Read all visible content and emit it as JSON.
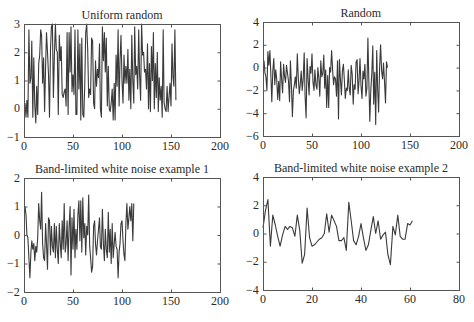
{
  "chart_data": [
    {
      "type": "line",
      "title": "Uniform random",
      "xlabel": "",
      "ylabel": "",
      "xlim": [
        0,
        200
      ],
      "ylim": [
        -1,
        3
      ],
      "xticks": [
        0,
        50,
        100,
        150,
        200
      ],
      "yticks": [
        -1,
        0,
        1,
        2,
        3
      ],
      "grid": false,
      "box": {
        "left": 24,
        "top": 24,
        "right": 220,
        "bottom": 137
      },
      "series": [
        {
          "name": "uniform",
          "color": "#3a3a3a",
          "x_start": 1,
          "x_step": 1,
          "values": [
            0.2,
            -0.3,
            0.3,
            -0.3,
            2.8,
            0.9,
            1.1,
            2.4,
            -0.3,
            1.8,
            0.1,
            -0.5,
            0.8,
            -0.2,
            1.6,
            1.9,
            2.8,
            2.6,
            0.9,
            1.8,
            -0.1,
            1.5,
            2.7,
            2.0,
            1.2,
            -0.3,
            2.1,
            2.9,
            3.0,
            0.4,
            1.9,
            3.0,
            2.1,
            2.0,
            -0.2,
            2.6,
            1.7,
            2.2,
            0.5,
            0.4,
            0.6,
            0.7,
            0.1,
            2.7,
            -0.2,
            2.7,
            1.3,
            2.9,
            0.6,
            1.2,
            0.5,
            2.8,
            -0.2,
            -0.2,
            2.8,
            0.7,
            2.3,
            -0.4,
            2.5,
            -0.2,
            -0.3,
            0.9,
            2.7,
            3.0,
            2.1,
            0.4,
            0.7,
            0.5,
            2.5,
            2.4,
            0.2,
            0.0,
            1.7,
            0.8,
            1.4,
            1.1,
            2.3,
            0.0,
            -0.3,
            2.9,
            1.7,
            2.7,
            1.3,
            2.5,
            0.1,
            1.5,
            0.0,
            -0.1,
            0.2,
            0.7,
            -0.4,
            0.9,
            -0.4,
            1.9,
            0.8,
            2.8,
            0.1,
            1.7,
            2.6,
            1.0,
            0.2,
            1.9,
            0.9,
            1.5,
            0.9,
            2.1,
            0.3,
            1.4,
            0.0,
            2.6,
            1.0,
            0.2,
            2.9,
            1.2,
            1.5,
            0.7,
            2.8,
            1.2,
            0.3,
            3.0,
            1.9,
            2.0,
            1.3,
            1.4,
            0.7,
            2.3,
            0.0,
            1.6,
            -0.1,
            2.2,
            1.0,
            2.7,
            0.0,
            1.6,
            0.4,
            2.0,
            -0.1,
            1.1,
            0.3,
            0.8,
            -0.3,
            2.8,
            0.2,
            0.0,
            -0.1,
            0.8,
            -0.1,
            0.4,
            0.9,
            0.1,
            2.3,
            1.1,
            0.8,
            2.8,
            0.3
          ]
        }
      ]
    },
    {
      "type": "line",
      "title": "Random",
      "xlabel": "",
      "ylabel": "",
      "xlim": [
        0,
        200
      ],
      "ylim": [
        -6,
        4
      ],
      "xticks": [
        0,
        50,
        100,
        150,
        200
      ],
      "yticks": [
        -6,
        -4,
        -2,
        0,
        2,
        4
      ],
      "grid": false,
      "box": {
        "left": 263,
        "top": 22,
        "right": 459,
        "bottom": 136
      },
      "series": [
        {
          "name": "randn",
          "color": "#3a3a3a",
          "x_start": 1,
          "x_step": 1,
          "values": [
            0.6,
            -0.5,
            -0.8,
            -2.0,
            1.4,
            0.2,
            1.5,
            -0.5,
            -3.0,
            -0.3,
            0.8,
            -1.5,
            -0.2,
            -1.0,
            -2.8,
            -1.2,
            -2.9,
            0.5,
            -1.0,
            -2.2,
            0.3,
            -0.8,
            -1.3,
            0.2,
            -0.5,
            -1.2,
            -3.0,
            0.6,
            -1.5,
            -4.3,
            -2.0,
            -1.5,
            -0.8,
            -1.8,
            1.2,
            -0.9,
            -2.3,
            -1.5,
            -0.3,
            -2.0,
            -1.0,
            1.3,
            -2.5,
            -4.4,
            0.8,
            -1.0,
            -2.4,
            0.1,
            -0.5,
            1.2,
            -1.3,
            -2.0,
            -0.2,
            -1.5,
            -1.9,
            0.0,
            -1.0,
            -2.5,
            0.6,
            -0.8,
            -0.5,
            1.1,
            -1.8,
            -0.2,
            -3.5,
            -0.7,
            -3.5,
            0.0,
            -0.4,
            1.5,
            -0.2,
            -1.5,
            -0.8,
            -1.0,
            -2.5,
            0.6,
            -4.5,
            0.7,
            -1.0,
            -2.4,
            -0.3,
            0.3,
            -1.0,
            -2.7,
            -1.8,
            -2.0,
            -0.2,
            -1.8,
            -2.4,
            0.2,
            -0.6,
            -3.2,
            -1.5,
            -1.9,
            0.5,
            0.7,
            -2.3,
            -1.2,
            0.8,
            -1.6,
            -2.7,
            -0.3,
            -1.0,
            0.3,
            -2.5,
            -1.8,
            2.6,
            -1.0,
            -4.7,
            -2.0,
            -0.5,
            1.9,
            -3.2,
            -0.4,
            -5.0,
            1.5,
            -2.0,
            -3.9,
            0.0,
            2.0,
            -0.3,
            -1.0,
            0.4,
            -1.2,
            -3.1,
            0.5,
            0.0
          ]
        }
      ]
    },
    {
      "type": "line",
      "title": "Band-limited white noise example 1",
      "xlabel": "",
      "ylabel": "",
      "xlim": [
        0,
        200
      ],
      "ylim": [
        -2,
        2
      ],
      "xticks": [
        0,
        50,
        100,
        150,
        200
      ],
      "yticks": [
        -2,
        -1,
        0,
        1,
        2
      ],
      "grid": false,
      "box": {
        "left": 24,
        "top": 178,
        "right": 220,
        "bottom": 292
      },
      "series": [
        {
          "name": "bandlimited1",
          "color": "#3a3a3a",
          "x_start": 1,
          "x_step": 1,
          "values": [
            1.0,
            0.7,
            0.0,
            -0.1,
            -0.8,
            -1.5,
            -0.6,
            -0.2,
            -0.5,
            -0.3,
            -0.9,
            -0.4,
            -0.6,
            -0.1,
            1.1,
            0.5,
            0.2,
            1.5,
            -0.3,
            -0.8,
            -0.9,
            0.4,
            -0.3,
            -1.2,
            0.6,
            0.5,
            -0.7,
            0.3,
            -0.4,
            -0.6,
            0.4,
            -0.8,
            0.3,
            -0.5,
            -1.0,
            0.4,
            -0.3,
            -0.8,
            0.5,
            -0.5,
            1.1,
            -0.6,
            -0.3,
            0.5,
            -0.9,
            0.3,
            1.0,
            -1.4,
            0.6,
            -0.5,
            0.9,
            -0.8,
            0.2,
            -0.5,
            0.7,
            1.2,
            -0.2,
            1.2,
            -0.6,
            1.3,
            -0.1,
            0.4,
            -0.7,
            0.3,
            0.0,
            1.4,
            -0.4,
            -0.8,
            -1.3,
            -1.1,
            0.3,
            0.5,
            -0.3,
            -0.7,
            -0.2,
            0.2,
            0.6,
            -0.4,
            -0.5,
            0.9,
            -0.3,
            -0.9,
            0.2,
            -0.5,
            -0.8,
            0.8,
            -0.6,
            0.2,
            -1.0,
            0.4,
            -0.8,
            -0.3,
            0.1,
            -0.4,
            -0.5,
            -1.5,
            -0.6,
            -0.3,
            0.4,
            0.5,
            -0.2,
            -0.7,
            -0.9,
            0.4,
            1.1,
            0.2,
            0.6,
            1.0,
            0.5,
            1.1,
            -0.2,
            1.1
          ]
        }
      ]
    },
    {
      "type": "line",
      "title": "Band-limited white noise example 2",
      "xlabel": "",
      "ylabel": "",
      "xlim": [
        0,
        80
      ],
      "ylim": [
        -4,
        4
      ],
      "xticks": [
        0,
        20,
        40,
        60,
        80
      ],
      "yticks": [
        -4,
        -2,
        0,
        2,
        4
      ],
      "grid": false,
      "box": {
        "left": 263,
        "top": 177,
        "right": 459,
        "bottom": 290
      },
      "series": [
        {
          "name": "bandlimited2",
          "color": "#3a3a3a",
          "x_start": 0,
          "x_step": 1,
          "values": [
            0.4,
            1.6,
            2.4,
            -0.9,
            1.3,
            0.6,
            -0.2,
            -0.9,
            -0.1,
            0.5,
            0.3,
            0.5,
            0.4,
            -0.2,
            1.3,
            0.2,
            -2.1,
            -1.5,
            1.8,
            -0.3,
            -0.9,
            -0.8,
            -0.6,
            -0.4,
            -0.3,
            0.0,
            1.4,
            0.1,
            1.3,
            0.9,
            0.5,
            -0.5,
            -0.5,
            -0.3,
            -1.2,
            2.2,
            0.9,
            -0.5,
            -0.8,
            -0.2,
            0.7,
            -0.3,
            -1.2,
            -0.8,
            0.2,
            1.2,
            0.0,
            0.9,
            -0.4,
            -0.1,
            0.1,
            -1.5,
            -2.2,
            0.5,
            -0.1,
            1.3,
            -0.2,
            -0.4,
            -0.4,
            0.7,
            0.6,
            0.9
          ]
        }
      ]
    }
  ]
}
